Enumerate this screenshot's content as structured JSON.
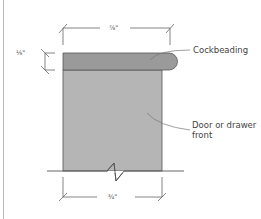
{
  "diagram": {
    "callouts": {
      "cockbeading": "Cockbeading",
      "door_front_line1": "Door or drawer",
      "door_front_line2": "front"
    },
    "dimensions": {
      "top_width": "⅞\"",
      "bead_thickness": "⅛\"",
      "front_thickness": "¾\""
    },
    "colors": {
      "cockbeading_fill": "#9a9a9a",
      "front_fill": "#b5b5b5",
      "outline": "#555555",
      "dimension_line": "#666666",
      "leader_line": "#777777"
    }
  }
}
